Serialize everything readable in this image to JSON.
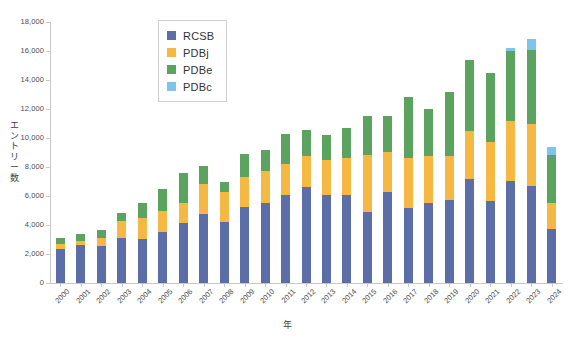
{
  "chart_data": {
    "type": "bar",
    "stacked": true,
    "title": "",
    "xlabel": "年",
    "ylabel": "エントリー数",
    "ylim": [
      0,
      18000
    ],
    "ytick_step": 2000,
    "grid": false,
    "legend_position": "top-center",
    "categories": [
      "2000",
      "2001",
      "2002",
      "2003",
      "2004",
      "2005",
      "2006",
      "2007",
      "2008",
      "2009",
      "2010",
      "2011",
      "2012",
      "2013",
      "2014",
      "2015",
      "2016",
      "2017",
      "2018",
      "2019",
      "2020",
      "2021",
      "2022",
      "2023",
      "2024"
    ],
    "ytick_labels": [
      "0",
      "2,000",
      "4,000",
      "6,000",
      "8,000",
      "10,000",
      "12,000",
      "14,000",
      "16,000",
      "18,000"
    ],
    "ytick_values": [
      0,
      2000,
      4000,
      6000,
      8000,
      10000,
      12000,
      14000,
      16000,
      18000
    ],
    "series": [
      {
        "name": "RCSB",
        "color": "#5b6ea8",
        "values": [
          2380,
          2620,
          2560,
          3100,
          3030,
          3500,
          4150,
          4780,
          4200,
          5250,
          5550,
          6050,
          6600,
          6050,
          6050,
          4900,
          6250,
          5200,
          5500,
          5750,
          7200,
          5650,
          7050,
          6700,
          3700
        ]
      },
      {
        "name": "PDBj",
        "color": "#f5b843",
        "values": [
          330,
          280,
          520,
          1200,
          1450,
          1500,
          1380,
          2030,
          2100,
          2030,
          2180,
          2170,
          2180,
          2430,
          2550,
          3950,
          2780,
          3450,
          3250,
          3000,
          3300,
          4100,
          4150,
          4300,
          1850
        ]
      },
      {
        "name": "PDBe",
        "color": "#5ba35e",
        "values": [
          370,
          450,
          570,
          550,
          1030,
          1500,
          2070,
          1230,
          700,
          1620,
          1470,
          2080,
          1800,
          1720,
          2100,
          2650,
          2470,
          4200,
          3280,
          4450,
          4850,
          4750,
          4800,
          5050,
          3300
        ]
      },
      {
        "name": "PDBc",
        "color": "#7ec4ec",
        "values": [
          0,
          0,
          0,
          0,
          0,
          0,
          0,
          0,
          0,
          0,
          0,
          0,
          0,
          0,
          0,
          0,
          0,
          0,
          0,
          0,
          0,
          0,
          200,
          750,
          550
        ]
      }
    ],
    "totals": [
      3080,
      3350,
      3650,
      4850,
      5510,
      6500,
      7600,
      8040,
      7000,
      8900,
      9200,
      10300,
      10580,
      10200,
      10700,
      11500,
      11500,
      12850,
      12030,
      13200,
      15350,
      14500,
      16200,
      16800,
      9400
    ]
  },
  "legend": {
    "items": [
      {
        "label": "RCSB",
        "color": "#5b6ea8"
      },
      {
        "label": "PDBj",
        "color": "#f5b843"
      },
      {
        "label": "PDBe",
        "color": "#5ba35e"
      },
      {
        "label": "PDBc",
        "color": "#7ec4ec"
      }
    ]
  },
  "axes": {
    "y_title_chars": [
      "エ",
      "ン",
      "ト",
      "リ",
      "ー",
      "数"
    ],
    "x_title": "年"
  }
}
